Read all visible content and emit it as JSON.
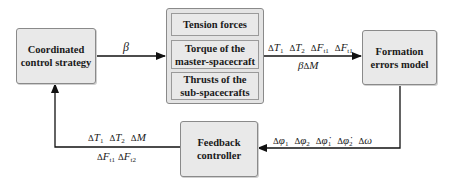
{
  "blocks": {
    "coordinated": "Coordinated control strategy",
    "coordinated_lines": [
      "Coordinated",
      "control strategy"
    ],
    "group_items": [
      {
        "lines": [
          "Tension forces"
        ]
      },
      {
        "lines": [
          "Torque of the",
          "master-spacecraft"
        ]
      },
      {
        "lines": [
          "Thrusts of the",
          "sub-spacecrafts"
        ]
      }
    ],
    "formation_lines": [
      "Formation",
      "errors model"
    ],
    "feedback_lines": [
      "Feedback",
      "controller"
    ]
  },
  "signals": {
    "beta": "β",
    "top_right_row1": [
      {
        "sym": "T",
        "sub": "1"
      },
      {
        "sym": "T",
        "sub": "2"
      },
      {
        "sym": "F",
        "sub": "t1"
      },
      {
        "sym": "F",
        "sub": "t1"
      }
    ],
    "top_right_row2": {
      "prefix": "β",
      "sym": "M"
    },
    "bottom_right": [
      {
        "sym": "φ",
        "sub": "1",
        "dot": false
      },
      {
        "sym": "φ",
        "sub": "2",
        "dot": false
      },
      {
        "sym": "φ̇",
        "sub": "1",
        "dot": true
      },
      {
        "sym": "φ̇",
        "sub": "2",
        "dot": true
      },
      {
        "sym": "ω",
        "sub": "",
        "dot": false
      }
    ],
    "bottom_left_row1": [
      {
        "sym": "T",
        "sub": "1"
      },
      {
        "sym": "T",
        "sub": "2"
      },
      {
        "sym": "M",
        "sub": ""
      }
    ],
    "bottom_left_row2": [
      {
        "sym": "F",
        "sub": "t1"
      },
      {
        "sym": "F",
        "sub": "t2"
      }
    ],
    "delta": "Δ"
  }
}
